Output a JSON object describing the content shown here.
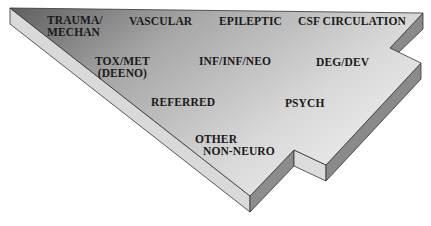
{
  "diagram": {
    "type": "block-shape-category-map",
    "colors": {
      "top_dark": "#6e6e6e",
      "top_light": "#e4e4e4",
      "side_light": "#d6d6d6",
      "side_dark": "#8a8a8a",
      "outline": "#333333"
    },
    "labels": {
      "trauma": "TRAUMA/",
      "trauma2": "MECHAN",
      "vascular": "VASCULAR",
      "epileptic": "EPILEPTIC",
      "csf": "CSF CIRCULATION",
      "toxmet": "TOX/MET",
      "toxmet2": "(DEENO)",
      "inf": "INF/INF/NEO",
      "deg": "DEG/DEV",
      "referred": "REFERRED",
      "psych": "PSYCH",
      "other": "OTHER",
      "other2": "NON-NEURO"
    }
  }
}
